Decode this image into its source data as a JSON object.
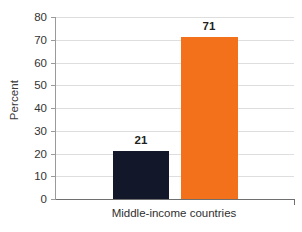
{
  "chart_data": {
    "type": "bar",
    "title": "",
    "xlabel": "Middle-income countries",
    "ylabel": "Percent",
    "categories": [
      "Middle-income countries"
    ],
    "ylim": [
      0,
      80
    ],
    "yticks": [
      0,
      10,
      20,
      30,
      40,
      50,
      60,
      70,
      80
    ],
    "grid": true,
    "legend": "none",
    "series": [
      {
        "name": "series-1",
        "color": "#12182a",
        "values": [
          21
        ],
        "labels": [
          "21"
        ]
      },
      {
        "name": "series-2",
        "color": "#f4711c",
        "values": [
          71
        ],
        "labels": [
          "71"
        ]
      }
    ],
    "bars": [
      {
        "name": "dark-bar",
        "value": 21,
        "label": "21",
        "color": "#12182a"
      },
      {
        "name": "orange-bar",
        "value": 71,
        "label": "71",
        "color": "#f4711c"
      }
    ],
    "tick_labels": {
      "t0": "0",
      "t10": "10",
      "t20": "20",
      "t30": "30",
      "t40": "40",
      "t50": "50",
      "t60": "60",
      "t70": "70",
      "t80": "80"
    },
    "colors": {
      "background": "#ffffff",
      "gridline": "#dedede",
      "axis": "#6f6f6f",
      "text": "#333333",
      "bar_dark": "#12182a",
      "bar_orange": "#f4711c"
    }
  }
}
